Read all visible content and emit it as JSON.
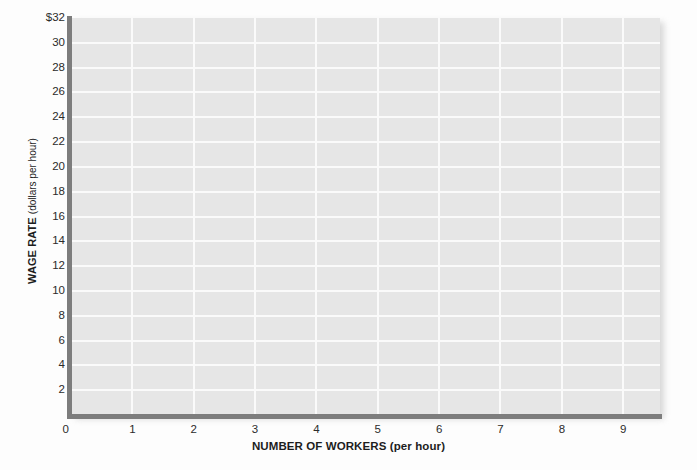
{
  "chart_data": {
    "type": "line",
    "title": "",
    "subtitle": "",
    "xlabel_main": "NUMBER OF WORKERS",
    "xlabel_unit": "(per hour)",
    "ylabel_main": "WAGE RATE",
    "ylabel_unit": "(dollars per hour)",
    "xlim": [
      0,
      9.6
    ],
    "ylim": [
      0,
      32
    ],
    "x_ticks": [
      "0",
      "1",
      "2",
      "3",
      "4",
      "5",
      "6",
      "7",
      "8",
      "9"
    ],
    "x_tick_values": [
      0,
      1,
      2,
      3,
      4,
      5,
      6,
      7,
      8,
      9
    ],
    "y_ticks": [
      "$32",
      "30",
      "28",
      "26",
      "24",
      "22",
      "20",
      "18",
      "16",
      "14",
      "12",
      "10",
      "8",
      "6",
      "4",
      "2"
    ],
    "y_tick_values": [
      32,
      30,
      28,
      26,
      24,
      22,
      20,
      18,
      16,
      14,
      12,
      10,
      8,
      6,
      4,
      2
    ],
    "y_origin_label": "0",
    "grid": true,
    "grid_x_step": 1,
    "grid_y_step": 2,
    "legend": [],
    "series": [],
    "annotations": [],
    "note": "Empty grid; no data series plotted",
    "colors": {
      "plot_background": "#e6e6e6",
      "gridline": "#fafafa",
      "axis_line": "#7d7d7d",
      "page_background": "#fdfdfd",
      "tick_text": "#2b2b2b",
      "title_text": "#1d1d1d"
    }
  }
}
